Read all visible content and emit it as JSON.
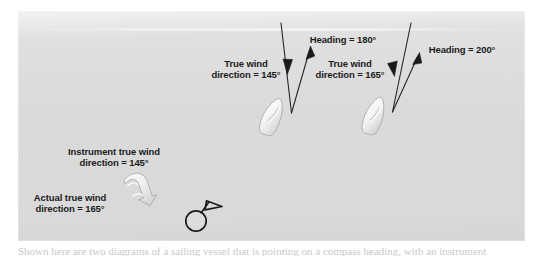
{
  "figure": {
    "background_color": "#dcdcdc",
    "text_color": "#1b1b1b",
    "stroke_color": "#262626",
    "boat_fill_color": "#f2f2f2",
    "labels": {
      "true_wind_1": "True wind\ndirection = 145°",
      "true_wind_1_line1": "True wind",
      "true_wind_1_line2": "direction = 145°",
      "heading_1": "Heading = 180°",
      "true_wind_2_line1": "True wind",
      "true_wind_2_line2": "direction = 165°",
      "heading_2": "Heading = 200°",
      "instrument_line1": "Instrument true wind",
      "instrument_line2": "direction = 145°",
      "actual_line1": "Actual true wind",
      "actual_line2": "direction = 165°"
    },
    "values": {
      "true_wind_direction_1": "145°",
      "heading_1": "180°",
      "true_wind_direction_2": "165°",
      "heading_2": "200°",
      "instrument_true_wind_direction": "145°",
      "actual_true_wind_direction": "165°"
    },
    "icons": {
      "wind_vane": "wind-vane-icon",
      "rotation_arrow": "curved-rotation-arrow-icon",
      "boat_1": "sailboat-hull-icon",
      "boat_2": "sailboat-hull-icon",
      "wind_arrow_1": "down-arrow-icon",
      "wind_arrow_2": "down-arrow-icon",
      "heading_arrow_1": "up-right-arrow-icon",
      "heading_arrow_2": "up-right-arrow-icon"
    }
  },
  "caption": {
    "cut_off_text": "Shown here are two diagrams of a sailing vessel that is pointing on a compass heading, with an instrument"
  }
}
